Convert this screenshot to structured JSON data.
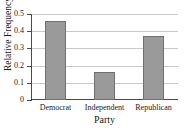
{
  "chart_data": {
    "type": "bar",
    "title": "Political Affiliation",
    "xlabel": "Party",
    "ylabel": "Relative Frequency",
    "categories": [
      "Democrat",
      "Independent",
      "Republican"
    ],
    "values": [
      0.46,
      0.16,
      0.37
    ],
    "ylim": [
      0,
      0.5
    ],
    "yticks": [
      0,
      0.1,
      0.2,
      0.3,
      0.4,
      0.5
    ],
    "ytick_labels": [
      "0",
      "0.1",
      "0.2",
      "0.3",
      "0.4",
      "0.5"
    ],
    "grid": true,
    "legend": false,
    "colors": {
      "bar_fill": "#9a9a9a",
      "bar_edge": "#6f6f6f",
      "gridline": "#c9c9c9",
      "axis": "#4a4a4a",
      "text": "#1a1a1a",
      "background": "#ffffff"
    }
  }
}
